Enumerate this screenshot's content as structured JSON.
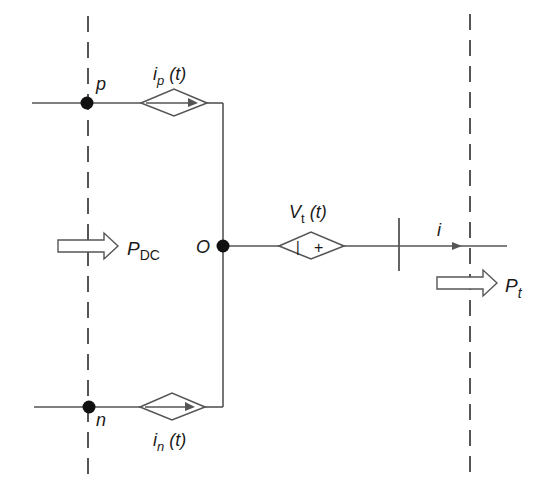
{
  "diagram": {
    "nodes": {
      "p": "p",
      "n": "n",
      "o": "O"
    },
    "sources": {
      "ip": {
        "label": "i",
        "sub": "p",
        "arg": " (t)"
      },
      "in": {
        "label": "i",
        "sub": "n",
        "arg": " (t)"
      },
      "vt": {
        "label": "V",
        "sub": "t",
        "arg": " (t)",
        "minus": "|",
        "plus": "+"
      }
    },
    "current": {
      "label": "i"
    },
    "power": {
      "dc": {
        "label": "P",
        "sub": "DC"
      },
      "t": {
        "label": "P",
        "sub": "t"
      }
    },
    "colors": {
      "line": "#555555",
      "dot": "#111111",
      "text": "#1a1a1a"
    }
  }
}
